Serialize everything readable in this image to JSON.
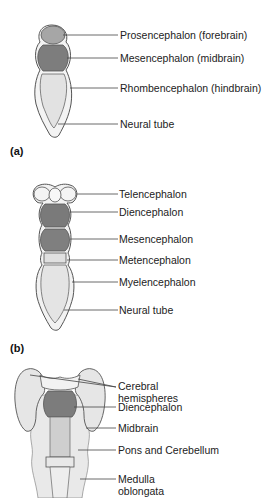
{
  "figure": {
    "panels": [
      {
        "id": "a",
        "label": "(a)",
        "labels": [
          "Prosencephalon (forebrain)",
          "Mesencephalon (midbrain)",
          "Rhombencephalon (hindbrain)",
          "Neural tube"
        ]
      },
      {
        "id": "b",
        "label": "(b)",
        "labels": [
          "Telencephalon",
          "Diencephalon",
          "Mesencephalon",
          "Metencephalon",
          "Myelencephalon",
          "Neural tube"
        ]
      },
      {
        "id": "c",
        "labels": [
          "Cerebral",
          "hemispheres",
          "Diencephalon",
          "Midbrain",
          "Pons and Cerebellum",
          "Medulla",
          "oblongata"
        ]
      }
    ],
    "colors": {
      "outline": "#555555",
      "dark_fill": "#7a7a7a",
      "mid_fill": "#9a9a9a",
      "light_fill": "#e6e6e6",
      "pale_fill": "#f2f2f2",
      "leader": "#444444"
    }
  }
}
